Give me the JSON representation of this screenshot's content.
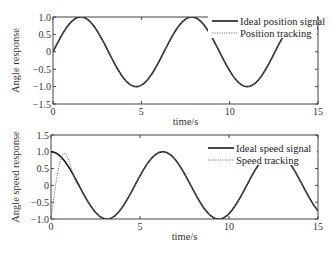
{
  "chart_data": [
    {
      "type": "line",
      "title": "",
      "xlabel": "time/s",
      "ylabel": "Angle response",
      "xlim": [
        0,
        15
      ],
      "ylim": [
        -1.5,
        1.0
      ],
      "xticks": [
        "0",
        "5",
        "10",
        "15"
      ],
      "yticks": [
        "1.0",
        "0.5",
        "0",
        "-0.5",
        "-1.0",
        "-1.5"
      ],
      "legend": {
        "position": "upper right",
        "entries": [
          "Ideal position signal",
          "Position tracking"
        ]
      },
      "series": [
        {
          "name": "Ideal position signal",
          "style": "solid",
          "function": "sin(t)",
          "x": [
            0,
            1.57,
            3.14,
            4.71,
            6.28,
            7.85,
            9.42,
            11.0,
            12.57,
            14.14,
            15
          ],
          "values": [
            0,
            1.0,
            0,
            -1.0,
            0,
            1.0,
            0,
            -1.0,
            0,
            1.0,
            0.65
          ]
        },
        {
          "name": "Position tracking",
          "style": "dotted",
          "function": "≈sin(t)",
          "x": [
            0,
            1.57,
            3.14,
            4.71,
            6.28,
            7.85,
            9.42,
            11.0,
            12.57,
            14.14,
            15
          ],
          "values": [
            0,
            1.0,
            0,
            -1.0,
            0,
            1.0,
            0,
            -1.0,
            0,
            1.0,
            0.65
          ]
        }
      ]
    },
    {
      "type": "line",
      "title": "",
      "xlabel": "time/s",
      "ylabel": "Angle speed response",
      "xlim": [
        0,
        15
      ],
      "ylim": [
        -1.0,
        1.5
      ],
      "xticks": [
        "0",
        "5",
        "10",
        "15"
      ],
      "yticks": [
        "1.5",
        "1.0",
        "0.5",
        "0",
        "-0.5",
        "-1.0"
      ],
      "legend": {
        "position": "upper right",
        "entries": [
          "Ideal speed signal",
          "Speed tracking"
        ]
      },
      "series": [
        {
          "name": "Ideal speed signal",
          "style": "solid",
          "function": "cos(t)",
          "x": [
            0,
            1.57,
            3.14,
            4.71,
            6.28,
            7.85,
            9.42,
            11.0,
            12.57,
            14.14,
            15
          ],
          "values": [
            1.0,
            0,
            -1.0,
            0,
            1.0,
            0,
            -1.0,
            0,
            1.0,
            0,
            -0.76
          ]
        },
        {
          "name": "Speed tracking",
          "style": "dotted",
          "x": [
            0,
            0.1,
            0.3,
            0.5,
            0.7,
            0.9,
            1.2,
            1.57,
            3.14,
            4.71,
            6.28,
            7.85,
            9.42,
            11.0,
            12.57,
            14.14,
            15
          ],
          "values": [
            -1.0,
            -0.8,
            0.0,
            0.75,
            0.95,
            0.7,
            0.36,
            0,
            -1.0,
            0,
            1.0,
            0,
            -1.0,
            0,
            1.0,
            0,
            -0.76
          ]
        }
      ]
    }
  ],
  "labels": {
    "top_ylabel": "Angle response",
    "bottom_ylabel": "Angle speed response",
    "xlabel": "time/s",
    "top_legend": [
      "Ideal position signal",
      "Position tracking"
    ],
    "bottom_legend": [
      "Ideal speed signal",
      "Speed tracking"
    ],
    "xticks": [
      "0",
      "5",
      "10",
      "15"
    ],
    "top_yticks": [
      "1.0",
      "0.5",
      "0",
      "-0.5",
      "-1.0",
      "-1.5"
    ],
    "bottom_yticks": [
      "1.5",
      "1.0",
      "0.5",
      "0",
      "-0.5",
      "-1.0"
    ]
  }
}
